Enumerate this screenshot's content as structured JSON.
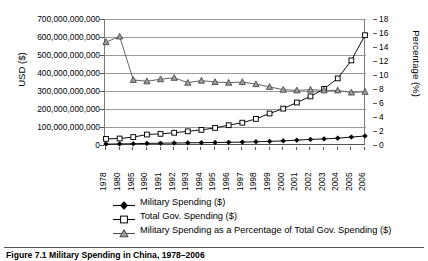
{
  "chart_data": {
    "type": "line",
    "title": "",
    "xlabel": "",
    "ylabel": "USD ($)",
    "ylabel_secondary": "Percentage (%)",
    "grid": true,
    "legend_position": "bottom",
    "categories": [
      "1978",
      "1980",
      "1985",
      "1990",
      "1991",
      "1992",
      "1993",
      "1994",
      "1995",
      "1996",
      "1997",
      "1998",
      "1999",
      "2000",
      "2001",
      "2002",
      "2003",
      "2004",
      "2005",
      "2006"
    ],
    "x": [
      "1978",
      "1980",
      "1985",
      "1990",
      "1991",
      "1992",
      "1993",
      "1994",
      "1995",
      "1996",
      "1997",
      "1998",
      "1999",
      "2000",
      "2001",
      "2002",
      "2003",
      "2004",
      "2005",
      "2006"
    ],
    "ylim": [
      0,
      700000000000
    ],
    "yticks": [
      0,
      100000000000,
      200000000000,
      300000000000,
      400000000000,
      500000000000,
      600000000000,
      700000000000
    ],
    "ytick_labels": [
      "0",
      "100,000,000,000",
      "200,000,000,000",
      "300,000,000,000",
      "400,000,000,000",
      "500,000,000,000",
      "600,000,000,000",
      "700,000,000,000"
    ],
    "ylim_secondary": [
      0,
      18
    ],
    "yticks_secondary": [
      0,
      2,
      4,
      6,
      8,
      10,
      12,
      14,
      16,
      18
    ],
    "ytick_labels_secondary": [
      "0",
      "2",
      "4",
      "6",
      "8",
      "10",
      "12",
      "14",
      "16",
      "18"
    ],
    "series": [
      {
        "name": "Military Spending ($)",
        "axis": "left",
        "marker": "filled-diamond",
        "color": "#000000",
        "values": [
          5000000000,
          6000000000,
          7000000000,
          9000000000,
          10000000000,
          11000000000,
          12000000000,
          13000000000,
          14000000000,
          15000000000,
          16000000000,
          18000000000,
          20000000000,
          23000000000,
          27000000000,
          31000000000,
          34000000000,
          38000000000,
          44000000000,
          50000000000
        ]
      },
      {
        "name": "Total Gov. Spending ($)",
        "axis": "left",
        "marker": "open-square",
        "color": "#000000",
        "values": [
          34000000000,
          36000000000,
          44000000000,
          58000000000,
          62000000000,
          68000000000,
          76000000000,
          84000000000,
          95000000000,
          110000000000,
          124000000000,
          145000000000,
          175000000000,
          202000000000,
          236000000000,
          270000000000,
          312000000000,
          370000000000,
          470000000000,
          610000000000
        ]
      },
      {
        "name": "Military Spending as a Percentage of Total Gov. Spending ($)",
        "axis": "right",
        "marker": "filled-triangle",
        "color": "#808080",
        "values": [
          14.7,
          15.5,
          9.3,
          9.1,
          9.4,
          9.6,
          8.9,
          9.2,
          9.0,
          8.9,
          9.0,
          8.7,
          8.3,
          7.9,
          7.8,
          7.9,
          7.8,
          7.8,
          7.5,
          7.6
        ]
      }
    ]
  },
  "axes": {
    "left_title": "USD ($)",
    "right_title": "Percentage (%)"
  },
  "legend": {
    "entries": [
      {
        "label": "Military Spending ($)",
        "marker": "filled-diamond"
      },
      {
        "label": "Total Gov. Spending ($)",
        "marker": "open-square"
      },
      {
        "label": "Military Spending as a Percentage of Total Gov. Spending ($)",
        "marker": "filled-triangle"
      }
    ]
  },
  "caption": {
    "text": "Figure 7.1 Military Spending in China, 1978–2006"
  },
  "colors": {
    "grid": "#9a9a9a",
    "axis": "#555555",
    "series_military": "#000000",
    "series_total": "#000000",
    "series_percentage": "#808080",
    "marker_fill_gray": "#9e9e9e"
  }
}
